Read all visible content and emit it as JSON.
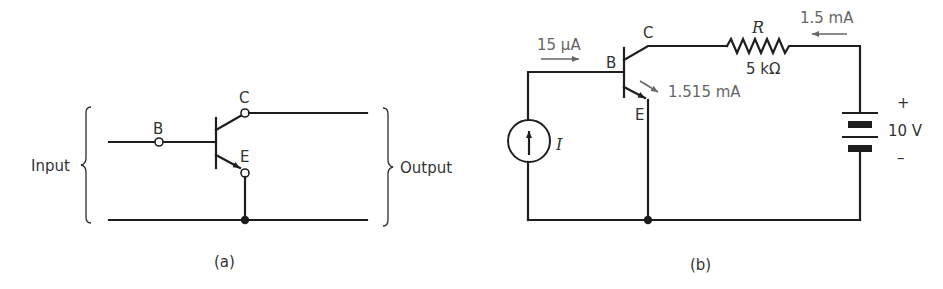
{
  "figure_a": {
    "caption": "(a)",
    "input_label": "Input",
    "output_label": "Output",
    "terminals": {
      "base": "B",
      "collector": "C",
      "emitter": "E"
    }
  },
  "figure_b": {
    "caption": "(b)",
    "terminals": {
      "base": "B",
      "collector": "C",
      "emitter": "E"
    },
    "base_current": "15 μA",
    "emitter_current": "1.515 mA",
    "collector_current": "1.5 mA",
    "resistor_name": "R",
    "resistor_value": "5 kΩ",
    "source_name": "I",
    "battery_voltage": "10 V",
    "battery_plus": "+",
    "battery_minus": "–"
  },
  "colors": {
    "wire": "#1e1e1e",
    "label": "#333333",
    "annotation": "#666666",
    "background": "#ffffff"
  }
}
